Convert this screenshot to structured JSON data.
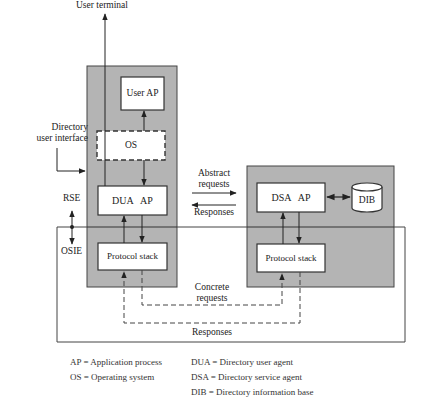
{
  "diagram": {
    "colors": {
      "system_fill": "#b4b4b4",
      "box_fill": "#ffffff",
      "line": "#333333"
    },
    "labels": {
      "user_terminal": "User terminal",
      "directory_user_interface_1": "Directory",
      "directory_user_interface_2": "user interface",
      "rse": "RSE",
      "osie": "OSIE",
      "abstract_requests_1": "Abstract",
      "abstract_requests_2": "requests",
      "responses_abstract": "Responses",
      "concrete_requests_1": "Concrete",
      "concrete_requests_2": "requests",
      "responses_concrete": "Responses"
    },
    "user_system": {
      "user_ap": "User AP",
      "os": "OS",
      "dua_ap": "DUA   AP",
      "protocol_stack": "Protocol stack"
    },
    "directory_system": {
      "dsa_ap": "DSA   AP",
      "dib": "DIB",
      "protocol_stack": "Protocol stack"
    },
    "legend": {
      "left": [
        "AP = Application process",
        "OS = Operating system"
      ],
      "right": [
        "DUA = Directory user agent",
        "DSA = Directory service agent",
        "DIB = Directory information base"
      ]
    }
  }
}
